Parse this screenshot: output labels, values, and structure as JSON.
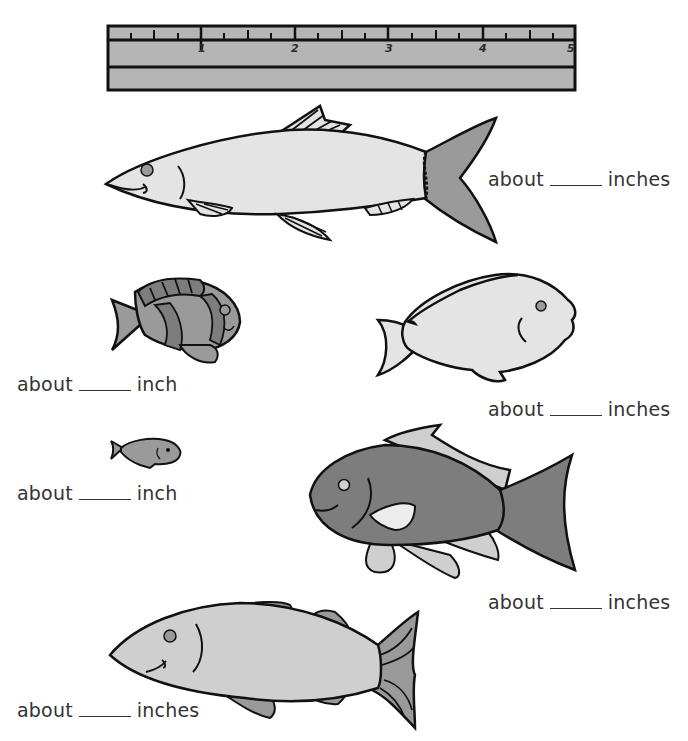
{
  "worksheet": {
    "ruler": {
      "unit": "inches",
      "numbers": [
        "1",
        "2",
        "3",
        "4",
        "5"
      ],
      "color": "#b5b5b5"
    },
    "fish": [
      {
        "id": "herring",
        "label_prefix": "about",
        "label_unit": "inches"
      },
      {
        "id": "striped-fish",
        "label_prefix": "about",
        "label_unit": "inch"
      },
      {
        "id": "white-fish",
        "label_prefix": "about",
        "label_unit": "inches"
      },
      {
        "id": "tiny-fish",
        "label_prefix": "about",
        "label_unit": "inch"
      },
      {
        "id": "dark-fish",
        "label_prefix": "about",
        "label_unit": "inches"
      },
      {
        "id": "trout",
        "label_prefix": "about",
        "label_unit": "inches"
      }
    ],
    "colors": {
      "light_fill": "#e4e4e4",
      "mid_fill": "#9a9a9a",
      "dark_fill": "#7d7d7d",
      "pale_fill": "#cfcfcf",
      "outline": "#111111"
    }
  }
}
